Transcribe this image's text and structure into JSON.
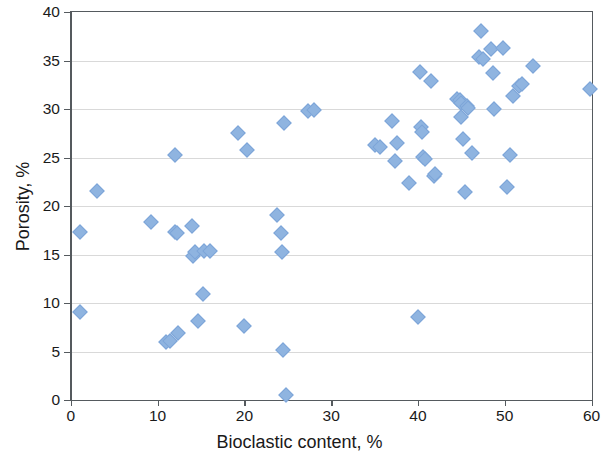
{
  "chart_data": {
    "type": "scatter",
    "title": "",
    "xlabel": "Bioclastic content, %",
    "ylabel": "Porosity, %",
    "xlim": [
      0,
      60
    ],
    "ylim": [
      0,
      40
    ],
    "xticks": [
      0,
      10,
      20,
      30,
      40,
      50,
      60
    ],
    "yticks": [
      0,
      5,
      10,
      15,
      20,
      25,
      30,
      35,
      40
    ],
    "grid": "horizontal",
    "legend": "none",
    "marker": "diamond",
    "marker_color": "#8fb4e0",
    "marker_edge_color": "#7da5d8",
    "series": [
      {
        "name": "samples",
        "points": [
          [
            1.0,
            17.3
          ],
          [
            1.0,
            9.1
          ],
          [
            3.0,
            21.6
          ],
          [
            9.2,
            18.4
          ],
          [
            11.0,
            6.0
          ],
          [
            11.4,
            6.1
          ],
          [
            12.0,
            25.3
          ],
          [
            12.0,
            17.3
          ],
          [
            12.2,
            17.2
          ],
          [
            12.3,
            6.9
          ],
          [
            14.0,
            17.9
          ],
          [
            14.1,
            14.8
          ],
          [
            14.3,
            15.3
          ],
          [
            14.6,
            8.1
          ],
          [
            15.2,
            10.9
          ],
          [
            15.3,
            15.4
          ],
          [
            16.0,
            15.4
          ],
          [
            19.3,
            27.5
          ],
          [
            20.0,
            7.6
          ],
          [
            20.3,
            25.8
          ],
          [
            23.8,
            19.1
          ],
          [
            24.2,
            17.2
          ],
          [
            24.3,
            15.3
          ],
          [
            24.5,
            5.2
          ],
          [
            24.6,
            28.6
          ],
          [
            24.8,
            0.5
          ],
          [
            27.3,
            29.8
          ],
          [
            28.0,
            29.9
          ],
          [
            35.0,
            26.3
          ],
          [
            35.6,
            26.1
          ],
          [
            37.0,
            28.8
          ],
          [
            37.4,
            24.6
          ],
          [
            37.6,
            26.5
          ],
          [
            39.0,
            22.4
          ],
          [
            40.0,
            8.6
          ],
          [
            40.2,
            33.8
          ],
          [
            40.4,
            28.2
          ],
          [
            40.5,
            27.6
          ],
          [
            40.6,
            25.1
          ],
          [
            40.8,
            24.8
          ],
          [
            41.5,
            32.9
          ],
          [
            41.8,
            23.1
          ],
          [
            42.0,
            23.3
          ],
          [
            44.5,
            31.0
          ],
          [
            44.8,
            30.9
          ],
          [
            44.9,
            29.2
          ],
          [
            45.0,
            30.6
          ],
          [
            45.2,
            26.9
          ],
          [
            45.4,
            21.4
          ],
          [
            45.6,
            30.3
          ],
          [
            45.8,
            30.1
          ],
          [
            46.2,
            25.5
          ],
          [
            47.0,
            35.4
          ],
          [
            47.3,
            38.0
          ],
          [
            47.5,
            35.2
          ],
          [
            48.4,
            36.2
          ],
          [
            48.6,
            33.7
          ],
          [
            48.8,
            30.0
          ],
          [
            49.8,
            36.3
          ],
          [
            50.2,
            22.0
          ],
          [
            50.6,
            25.3
          ],
          [
            51.0,
            31.3
          ],
          [
            51.6,
            32.4
          ],
          [
            52.0,
            32.6
          ],
          [
            53.2,
            34.4
          ],
          [
            59.8,
            32.1
          ]
        ]
      }
    ]
  },
  "axes": {
    "y_tick_labels": [
      "40",
      "35",
      "30",
      "25",
      "20",
      "15",
      "10",
      "5",
      "0"
    ],
    "x_tick_labels": [
      "0",
      "10",
      "20",
      "30",
      "40",
      "50",
      "60"
    ],
    "x_title": "Bioclastic content, %",
    "y_title": "Porosity, %"
  }
}
